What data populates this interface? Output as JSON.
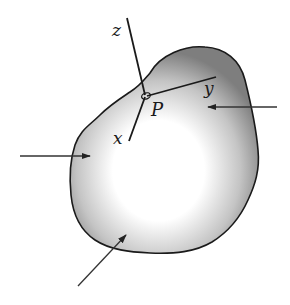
{
  "figure": {
    "point_label": "P",
    "axes": [
      {
        "name": "z",
        "label": "z"
      },
      {
        "name": "y",
        "label": "y"
      },
      {
        "name": "x",
        "label": "x"
      }
    ],
    "forces": [
      {
        "name": "right-force",
        "direction": "leftward"
      },
      {
        "name": "left-force",
        "direction": "rightward"
      },
      {
        "name": "bottom-force",
        "direction": "up-right"
      }
    ],
    "colors": {
      "outline": "#1a1a1a",
      "shade_dark": "#7a7a7a",
      "shade_light": "#ffffff",
      "arrow": "#333333"
    }
  }
}
